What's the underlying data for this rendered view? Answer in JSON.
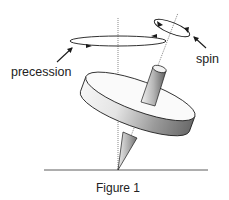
{
  "figure": {
    "caption": "Figure 1",
    "labels": {
      "precession": "precession",
      "spin": "spin"
    },
    "colors": {
      "line": "#1a1a1a",
      "axis": "#555555",
      "shade_dark": "#6e6e6e",
      "shade_light": "#f4f4f4",
      "background": "#ffffff"
    }
  }
}
